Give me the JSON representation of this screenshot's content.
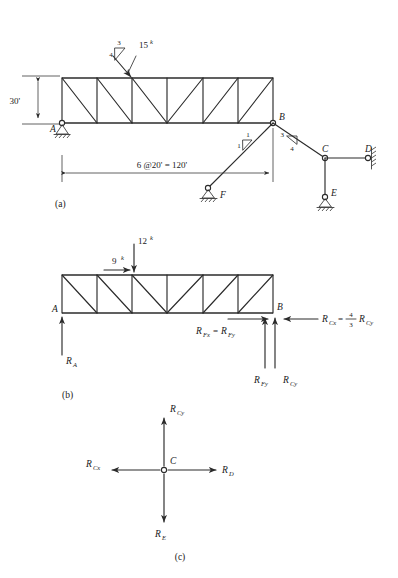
{
  "figure": {
    "kind": "structural-analysis-truss-diagram",
    "panels": [
      {
        "id": "a",
        "caption": "(a)"
      },
      {
        "id": "b",
        "caption": "(b)"
      },
      {
        "id": "c",
        "caption": "(c)"
      }
    ]
  },
  "panel_a": {
    "caption": "(a)",
    "height_dim": "30'",
    "span_dim": "6 @20' = 120'",
    "load": {
      "magnitude": "15",
      "unit": "k",
      "slope_rise": "3",
      "slope_run": "4"
    },
    "member_bf_slope": {
      "rise": "1",
      "run": "1"
    },
    "member_bc_slope": {
      "rise": "3",
      "run": "4"
    },
    "joints": [
      {
        "label": "A",
        "type": "pin-support"
      },
      {
        "label": "B",
        "type": "joint"
      },
      {
        "label": "C",
        "type": "joint"
      },
      {
        "label": "D",
        "type": "wall-pin-support"
      },
      {
        "label": "E",
        "type": "roller-support"
      },
      {
        "label": "F",
        "type": "pin-support"
      }
    ]
  },
  "panel_b": {
    "caption": "(b)",
    "loads": [
      {
        "label": "9",
        "unit": "k",
        "direction": "horizontal-right"
      },
      {
        "label": "12",
        "unit": "k",
        "direction": "vertical-down"
      }
    ],
    "reactions": [
      {
        "base": "R",
        "sub": "A",
        "text": "R",
        "subtext": "A"
      },
      {
        "text_full": "R₁ₓ = R₁ᵧ",
        "lhs_base": "R",
        "lhs_sub": "Fx",
        "rhs_base": "R",
        "rhs_sub": "Fy"
      },
      {
        "base": "R",
        "sub": "Fy"
      },
      {
        "base": "R",
        "sub": "Cy"
      },
      {
        "base": "R",
        "sub": "Cx",
        "relation": "=",
        "coef_num": "4",
        "coef_den": "3",
        "rhs_base": "R",
        "rhs_sub": "Cy"
      }
    ],
    "labels": {
      "A": "A",
      "B": "B",
      "RA": "R",
      "RA_sub": "A",
      "RFx": "R",
      "RFx_sub": "Fx",
      "RFy_eq": "R",
      "RFy_eq_sub": "Fy",
      "RFy": "R",
      "RFy_sub": "Fy",
      "RCy": "R",
      "RCy_sub": "Cy",
      "RCx": "R",
      "RCx_sub": "Cx",
      "equals": "=",
      "frac_num": "4",
      "frac_den": "3",
      "RCy2": "R",
      "RCy2_sub": "Cy"
    }
  },
  "panel_c": {
    "caption": "(c)",
    "joint_label": "C",
    "forces": [
      {
        "base": "R",
        "sub": "Cy",
        "direction": "up"
      },
      {
        "base": "R",
        "sub": "Cx",
        "direction": "left"
      },
      {
        "base": "R",
        "sub": "D",
        "direction": "right"
      },
      {
        "base": "R",
        "sub": "E",
        "direction": "down"
      }
    ],
    "labels": {
      "RCy": "R",
      "RCy_sub": "Cy",
      "RCx": "R",
      "RCx_sub": "Cx",
      "RD": "R",
      "RD_sub": "D",
      "RE": "R",
      "RE_sub": "E"
    }
  },
  "colors": {
    "ink": "#2b2b2b",
    "paper": "#ffffff"
  }
}
